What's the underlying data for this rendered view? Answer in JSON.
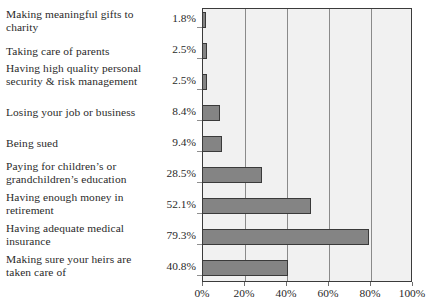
{
  "chart_data": {
    "type": "bar",
    "orientation": "horizontal",
    "title": "",
    "subtitle": "",
    "xlabel": "",
    "ylabel": "",
    "xlim": [
      0,
      100
    ],
    "xticks": [
      "0%",
      "20%",
      "40%",
      "60%",
      "80%",
      "100%"
    ],
    "xtick_values": [
      0,
      20,
      40,
      60,
      80,
      100
    ],
    "grid": true,
    "legend": false,
    "legend_position": "none",
    "categories": [
      "Making meaningful gifts to charity",
      "Taking care of parents",
      "Having high quality personal security & risk management",
      "Losing your job or business",
      "Being sued",
      "Paying for children’s or grandchildren’s education",
      "Having enough money in retirement",
      "Having adequate medical insurance",
      "Making sure your heirs are taken care of"
    ],
    "values": [
      1.8,
      2.5,
      2.5,
      8.4,
      9.4,
      28.5,
      52.1,
      79.3,
      40.8
    ],
    "value_labels": [
      "1.8%",
      "2.5%",
      "2.5%",
      "8.4%",
      "9.4%",
      "28.5%",
      "52.1%",
      "79.3%",
      "40.8%"
    ],
    "colors": {
      "bar_fill": "#848484",
      "bar_border": "#3a3a3a",
      "plot_background": "#f1f1f1",
      "gridline": "#8a8a8a",
      "axis": "#3b3b3b",
      "text": "#2a2a2a",
      "page_background": "#ffffff"
    }
  },
  "rows": [
    {
      "label": "Making meaningful gifts to charity",
      "value_label": "1.8%",
      "value": 1.8,
      "lines": 2
    },
    {
      "label": "Taking care of parents",
      "value_label": "2.5%",
      "value": 2.5,
      "lines": 1
    },
    {
      "label": "Having high quality personal security & risk management",
      "value_label": "2.5%",
      "value": 2.5,
      "lines": 2
    },
    {
      "label": "Losing your job or business",
      "value_label": "8.4%",
      "value": 8.4,
      "lines": 1
    },
    {
      "label": "Being sued",
      "value_label": "9.4%",
      "value": 9.4,
      "lines": 1
    },
    {
      "label": "Paying for children’s or grandchildren’s education",
      "value_label": "28.5%",
      "value": 28.5,
      "lines": 2
    },
    {
      "label": "Having enough money in retirement",
      "value_label": "52.1%",
      "value": 52.1,
      "lines": 2
    },
    {
      "label": "Having adequate medical insurance",
      "value_label": "79.3%",
      "value": 79.3,
      "lines": 2
    },
    {
      "label": "Making sure your heirs are taken care of",
      "value_label": "40.8%",
      "value": 40.8,
      "lines": 2
    }
  ],
  "axis": {
    "ticks": [
      "0%",
      "20%",
      "40%",
      "60%",
      "80%",
      "100%"
    ]
  }
}
